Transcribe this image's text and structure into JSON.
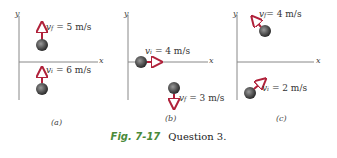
{
  "figure": {
    "label": "Fig. 7-17",
    "caption": "Question 3."
  },
  "colors": {
    "arrow": "#b0213a",
    "ball": "#555555",
    "axis": "#888888",
    "fig_label": "#4a8a3a"
  },
  "panels": [
    {
      "id": "a",
      "label": "(a)",
      "axis_y": "y",
      "axis_x": "x",
      "vectors": [
        {
          "name": "v",
          "sub": "f",
          "text": " = 5 m/s",
          "direction": "up"
        },
        {
          "name": "v",
          "sub": "i",
          "text": " = 6 m/s",
          "direction": "up"
        }
      ]
    },
    {
      "id": "b",
      "label": "(b)",
      "axis_y": "y",
      "axis_x": "x",
      "vectors": [
        {
          "name": "v",
          "sub": "i",
          "text": " = 4 m/s",
          "direction": "right"
        },
        {
          "name": "v",
          "sub": "f",
          "text": " = 3 m/s",
          "direction": "down"
        }
      ]
    },
    {
      "id": "c",
      "label": "(c)",
      "axis_y": "y",
      "axis_x": "x",
      "vectors": [
        {
          "name": "v",
          "sub": "f",
          "text": "= 4 m/s",
          "direction": "up-left"
        },
        {
          "name": "v",
          "sub": "i",
          "text": " = 2 m/s",
          "direction": "up-right"
        }
      ]
    }
  ]
}
